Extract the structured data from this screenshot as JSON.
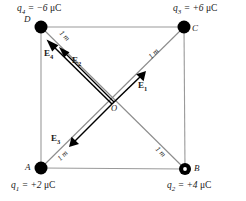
{
  "figure": {
    "type": "physics-diagram",
    "width": 246,
    "height": 201,
    "colors": {
      "square_edge": "#9a9a9a",
      "diagonal": "#8c8c8c",
      "vector": "#000000",
      "charge_dot": "#000000",
      "text": "#1a1a1a"
    }
  },
  "charges": [
    {
      "id": "q1",
      "vertex": "A",
      "vertex_label": "A",
      "label": "q",
      "subscript": "1",
      "equals": " = +2 ",
      "unit": "μC",
      "value": 2,
      "sign": "+",
      "position": "bottom-left",
      "dot_style": "filled"
    },
    {
      "id": "q2",
      "vertex": "B",
      "vertex_label": "B",
      "label": "q",
      "subscript": "2",
      "equals": " = +4 ",
      "unit": "μC",
      "value": 4,
      "sign": "+",
      "position": "bottom-right",
      "dot_style": "ring"
    },
    {
      "id": "q3",
      "vertex": "C",
      "vertex_label": "C",
      "label": "q",
      "subscript": "3",
      "equals": " = +6 ",
      "unit": "μC",
      "value": 6,
      "sign": "+",
      "position": "top-right",
      "dot_style": "filled"
    },
    {
      "id": "q4",
      "vertex": "D",
      "vertex_label": "D",
      "label": "q",
      "subscript": "4",
      "equals": " = −6 ",
      "unit": "μC",
      "value": -6,
      "sign": "−",
      "position": "top-left",
      "dot_style": "filled"
    }
  ],
  "center": {
    "label": "O",
    "name": "center-point"
  },
  "distances": [
    {
      "id": "dist-DO",
      "text": "1 m",
      "along": "D-to-O"
    },
    {
      "id": "dist-OC",
      "text": "1 m",
      "along": "O-to-C"
    },
    {
      "id": "dist-AO",
      "text": "1 m",
      "along": "A-to-O"
    },
    {
      "id": "dist-OB",
      "text": "1 m",
      "along": "O-to-B"
    }
  ],
  "field_vectors": [
    {
      "id": "E1",
      "label": "E",
      "subscript": "1",
      "from": "O",
      "toward": "C",
      "direction": "up-right",
      "source_charge": "q1"
    },
    {
      "id": "E2",
      "label": "E",
      "subscript": "2",
      "from": "O",
      "toward": "D",
      "direction": "up-left",
      "source_charge": "q2"
    },
    {
      "id": "E3",
      "label": "E",
      "subscript": "3",
      "from": "O",
      "toward": "A",
      "direction": "down-left",
      "source_charge": "q3"
    },
    {
      "id": "E4",
      "label": "E",
      "subscript": "4",
      "from": "O",
      "toward": "D",
      "direction": "up-left",
      "source_charge": "q4"
    }
  ]
}
